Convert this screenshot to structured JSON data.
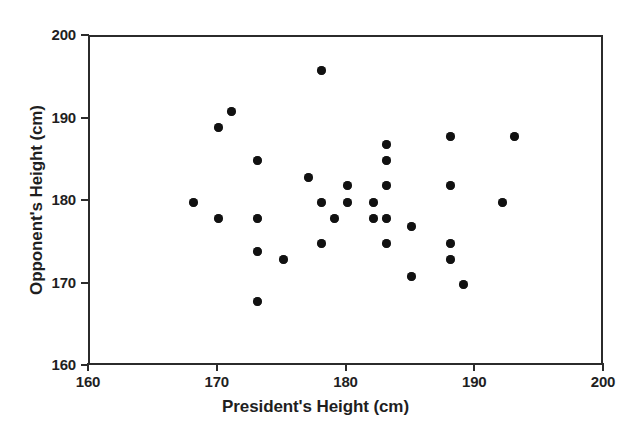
{
  "chart_data": {
    "type": "scatter",
    "title": "",
    "xlabel": "President's Height (cm)",
    "ylabel": "Opponent's Height (cm)",
    "xlim": [
      160,
      200
    ],
    "ylim": [
      160,
      200
    ],
    "xticks": [
      160,
      170,
      180,
      190,
      200
    ],
    "yticks": [
      160,
      170,
      180,
      190,
      200
    ],
    "xtick_labels": [
      "160",
      "170",
      "180",
      "190",
      "200"
    ],
    "ytick_labels": [
      "160",
      "170",
      "180",
      "190",
      "200"
    ],
    "grid": false,
    "legend": false,
    "marker_color": "#111111",
    "axis_color": "#2b2b2b",
    "background_color": "#ffffff",
    "series": [
      {
        "name": "President vs Opponent height",
        "points": [
          [
            168,
            180
          ],
          [
            170,
            189
          ],
          [
            170,
            178
          ],
          [
            171,
            191
          ],
          [
            173,
            185
          ],
          [
            173,
            178
          ],
          [
            173,
            174
          ],
          [
            173,
            168
          ],
          [
            175,
            173
          ],
          [
            177,
            183
          ],
          [
            178,
            196
          ],
          [
            178,
            180
          ],
          [
            178,
            175
          ],
          [
            179,
            178
          ],
          [
            180,
            182
          ],
          [
            180,
            180
          ],
          [
            182,
            180
          ],
          [
            182,
            178
          ],
          [
            183,
            187
          ],
          [
            183,
            185
          ],
          [
            183,
            182
          ],
          [
            183,
            178
          ],
          [
            183,
            175
          ],
          [
            185,
            177
          ],
          [
            185,
            171
          ],
          [
            188,
            188
          ],
          [
            188,
            182
          ],
          [
            188,
            175
          ],
          [
            188,
            173
          ],
          [
            189,
            170
          ],
          [
            192,
            180
          ],
          [
            193,
            188
          ]
        ]
      }
    ]
  }
}
